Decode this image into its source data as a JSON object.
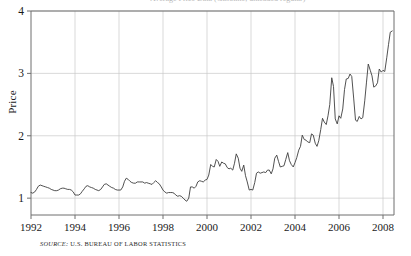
{
  "figure": {
    "source_prefix": "SOURCE:",
    "source_text": "U.S. BUREAU OF LABOR STATISTICS",
    "clipped_title": "Average Price Data (Gasoline, unleaded regular)"
  },
  "chart_data": {
    "type": "line",
    "title": "",
    "xlabel": "",
    "ylabel": "Price",
    "xlim": [
      1992.0,
      2008.5
    ],
    "ylim": [
      0.73,
      4.0
    ],
    "xticks": [
      1992,
      1994,
      1996,
      1998,
      2000,
      2002,
      2004,
      2006,
      2008
    ],
    "xtick_labels": [
      "1992",
      "1994",
      "1996",
      "1998",
      "2000",
      "2002",
      "2004",
      "2006",
      "2008"
    ],
    "yticks": [
      1,
      2,
      3,
      4
    ],
    "ytick_labels": [
      "1",
      "2",
      "3",
      "4"
    ],
    "grid": true,
    "legend": "none",
    "line_color": "#3d3d3d",
    "grid_color": "#c8c8c8",
    "axis_color": "#6e6e6e",
    "series": [
      {
        "name": "Price",
        "x": [
          1992.0,
          1992.08,
          1992.17,
          1992.25,
          1992.33,
          1992.42,
          1992.5,
          1992.58,
          1992.67,
          1992.75,
          1992.83,
          1992.92,
          1993.0,
          1993.08,
          1993.17,
          1993.25,
          1993.33,
          1993.42,
          1993.5,
          1993.58,
          1993.67,
          1993.75,
          1993.83,
          1993.92,
          1994.0,
          1994.08,
          1994.17,
          1994.25,
          1994.33,
          1994.42,
          1994.5,
          1994.58,
          1994.67,
          1994.75,
          1994.83,
          1994.92,
          1995.0,
          1995.08,
          1995.17,
          1995.25,
          1995.33,
          1995.42,
          1995.5,
          1995.58,
          1995.67,
          1995.75,
          1995.83,
          1995.92,
          1996.0,
          1996.08,
          1996.17,
          1996.25,
          1996.33,
          1996.42,
          1996.5,
          1996.58,
          1996.67,
          1996.75,
          1996.83,
          1996.92,
          1997.0,
          1997.08,
          1997.17,
          1997.25,
          1997.33,
          1997.42,
          1997.5,
          1997.58,
          1997.67,
          1997.75,
          1997.83,
          1997.92,
          1998.0,
          1998.08,
          1998.17,
          1998.25,
          1998.33,
          1998.42,
          1998.5,
          1998.58,
          1998.67,
          1998.75,
          1998.83,
          1998.92,
          1999.0,
          1999.08,
          1999.17,
          1999.25,
          1999.33,
          1999.42,
          1999.5,
          1999.58,
          1999.67,
          1999.75,
          1999.83,
          1999.92,
          2000.0,
          2000.08,
          2000.17,
          2000.25,
          2000.33,
          2000.42,
          2000.5,
          2000.58,
          2000.67,
          2000.75,
          2000.83,
          2000.92,
          2001.0,
          2001.08,
          2001.17,
          2001.25,
          2001.33,
          2001.42,
          2001.5,
          2001.58,
          2001.67,
          2001.75,
          2001.83,
          2001.92,
          2002.0,
          2002.08,
          2002.17,
          2002.25,
          2002.33,
          2002.42,
          2002.5,
          2002.58,
          2002.67,
          2002.75,
          2002.83,
          2002.92,
          2003.0,
          2003.08,
          2003.17,
          2003.25,
          2003.33,
          2003.42,
          2003.5,
          2003.58,
          2003.67,
          2003.75,
          2003.83,
          2003.92,
          2004.0,
          2004.08,
          2004.17,
          2004.25,
          2004.33,
          2004.42,
          2004.5,
          2004.58,
          2004.67,
          2004.75,
          2004.83,
          2004.92,
          2005.0,
          2005.08,
          2005.17,
          2005.25,
          2005.33,
          2005.42,
          2005.5,
          2005.58,
          2005.67,
          2005.75,
          2005.83,
          2005.92,
          2006.0,
          2006.08,
          2006.17,
          2006.25,
          2006.33,
          2006.42,
          2006.5,
          2006.58,
          2006.67,
          2006.75,
          2006.83,
          2006.92,
          2007.0,
          2007.08,
          2007.17,
          2007.25,
          2007.33,
          2007.42,
          2007.5,
          2007.58,
          2007.67,
          2007.75,
          2007.83,
          2007.92,
          2008.0,
          2008.08,
          2008.17,
          2008.25,
          2008.33,
          2008.42
        ],
        "values": [
          1.09,
          1.08,
          1.1,
          1.14,
          1.19,
          1.21,
          1.2,
          1.19,
          1.18,
          1.17,
          1.16,
          1.14,
          1.13,
          1.12,
          1.12,
          1.13,
          1.15,
          1.16,
          1.16,
          1.15,
          1.14,
          1.14,
          1.13,
          1.1,
          1.05,
          1.05,
          1.05,
          1.07,
          1.11,
          1.15,
          1.19,
          1.2,
          1.18,
          1.17,
          1.16,
          1.14,
          1.13,
          1.12,
          1.14,
          1.18,
          1.22,
          1.23,
          1.21,
          1.19,
          1.17,
          1.16,
          1.14,
          1.13,
          1.13,
          1.13,
          1.18,
          1.27,
          1.32,
          1.3,
          1.27,
          1.25,
          1.24,
          1.24,
          1.26,
          1.26,
          1.26,
          1.26,
          1.24,
          1.25,
          1.24,
          1.23,
          1.22,
          1.25,
          1.28,
          1.25,
          1.23,
          1.18,
          1.13,
          1.1,
          1.08,
          1.09,
          1.09,
          1.09,
          1.08,
          1.05,
          1.03,
          1.04,
          1.03,
          1.0,
          0.97,
          0.95,
          1.0,
          1.18,
          1.18,
          1.16,
          1.19,
          1.26,
          1.28,
          1.27,
          1.26,
          1.29,
          1.3,
          1.37,
          1.54,
          1.51,
          1.5,
          1.62,
          1.59,
          1.51,
          1.58,
          1.56,
          1.55,
          1.49,
          1.47,
          1.48,
          1.45,
          1.56,
          1.71,
          1.64,
          1.48,
          1.43,
          1.53,
          1.36,
          1.26,
          1.13,
          1.14,
          1.13,
          1.25,
          1.4,
          1.42,
          1.4,
          1.41,
          1.42,
          1.41,
          1.45,
          1.45,
          1.39,
          1.47,
          1.64,
          1.69,
          1.59,
          1.5,
          1.51,
          1.52,
          1.62,
          1.73,
          1.6,
          1.54,
          1.5,
          1.57,
          1.65,
          1.77,
          1.83,
          2.01,
          1.94,
          1.93,
          1.9,
          1.89,
          2.03,
          2.01,
          1.88,
          1.83,
          1.92,
          2.1,
          2.28,
          2.22,
          2.18,
          2.32,
          2.5,
          2.93,
          2.79,
          2.27,
          2.19,
          2.32,
          2.28,
          2.43,
          2.74,
          2.91,
          2.92,
          2.99,
          2.95,
          2.59,
          2.25,
          2.23,
          2.31,
          2.27,
          2.29,
          2.56,
          2.86,
          3.15,
          3.05,
          2.96,
          2.78,
          2.8,
          2.85,
          3.07,
          3.02,
          3.05,
          3.03,
          3.25,
          3.46,
          3.66,
          3.68
        ]
      }
    ]
  }
}
